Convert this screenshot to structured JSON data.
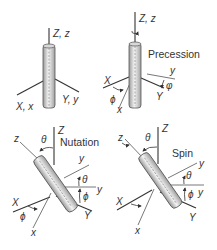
{
  "figure": {
    "colors": {
      "line": "#333333",
      "rod_light": "#f2f2f2",
      "rod_dark": "#9a9a9a",
      "background": "#ffffff"
    },
    "panels": [
      {
        "id": "initial",
        "title": "",
        "labels": {
          "z_axis": "Z, z",
          "x_axis": "X, x",
          "y_axis": "Y, y"
        }
      },
      {
        "id": "precession",
        "title": "Precession",
        "labels": {
          "z_axis": "Z, z",
          "X": "X",
          "x": "x",
          "Y": "Y",
          "y": "y",
          "angle_x": "ϕ",
          "angle_y": "φ"
        }
      },
      {
        "id": "nutation",
        "title": "Nutation",
        "labels": {
          "Z": "Z",
          "z": "z",
          "X": "X",
          "x": "x",
          "Y": "Y",
          "y": "y",
          "y2": "y",
          "theta_top": "θ",
          "theta_right": "θ",
          "phi_right": "ϕ",
          "phi_left": "ϕ"
        }
      },
      {
        "id": "spin",
        "title": "Spin",
        "labels": {
          "Z": "Z",
          "z": "z",
          "X": "X",
          "x": "x",
          "Y": "Y",
          "y": "y",
          "y2": "y",
          "theta_top": "θ",
          "theta_right": "θ",
          "phi_right": "ϕ"
        }
      }
    ]
  }
}
